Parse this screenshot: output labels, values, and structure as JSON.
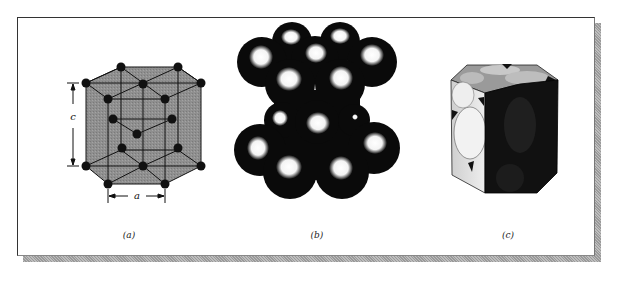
{
  "figure": {
    "panels": [
      {
        "id": "a",
        "caption": "(a)",
        "description": "HCP unit cell ball-and-stick model",
        "dimension_labels": {
          "height": "c",
          "width": "a"
        }
      },
      {
        "id": "b",
        "caption": "(b)",
        "description": "HCP hard-sphere model"
      },
      {
        "id": "c",
        "caption": "(c)",
        "description": "Sectioned HCP unit cell showing atom slices"
      }
    ],
    "colors": {
      "cell_fill": "#8c8c8c",
      "atom": "#111111",
      "frame_shadow": "#a9a9a9"
    }
  }
}
